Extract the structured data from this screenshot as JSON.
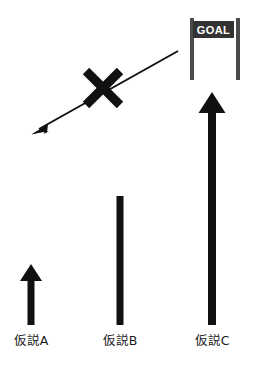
{
  "figure": {
    "title_visible": false,
    "background_color": "#ffffff",
    "ink_color": "#111111",
    "goal_sign": {
      "label": "GOAL",
      "banner_color": "#333333",
      "banner_text_color": "#ffffff",
      "post_color": "#4a4a4a",
      "post_left_x": 191,
      "post_right_x": 238,
      "post_top_y": 18,
      "post_bottom_y": 80,
      "banner_x": 193,
      "banner_y": 21,
      "banner_width": 40,
      "banner_height": 16
    },
    "rejected_path": {
      "name": "crossed-out-diagonal-arrow",
      "start_x": 178,
      "start_y": 51,
      "end_x": 33,
      "end_y": 133,
      "stroke_width": 2,
      "arrowhead_at": "end",
      "cross_mark": {
        "center_x": 103,
        "center_y": 88,
        "size": 38,
        "stroke_width": 9
      }
    },
    "hypotheses": [
      {
        "id": "a",
        "label": "仮説A",
        "arrow_x": 31,
        "arrow_top_y": 265,
        "arrow_bottom_y": 325,
        "shaft_width": 7,
        "head_width": 22,
        "head_height": 16,
        "reaches_goal": false
      },
      {
        "id": "b",
        "label": "仮説B",
        "arrow_x": 120,
        "arrow_top_y": 180,
        "arrow_bottom_y": 325,
        "shaft_width": 7,
        "head_width": 24,
        "head_height": 18,
        "reaches_goal": false
      },
      {
        "id": "c",
        "label": "仮説C",
        "arrow_x": 212,
        "arrow_top_y": 93,
        "arrow_bottom_y": 325,
        "shaft_width": 8,
        "head_width": 27,
        "head_height": 20,
        "reaches_goal": true
      }
    ],
    "label_baseline_y": 344
  }
}
